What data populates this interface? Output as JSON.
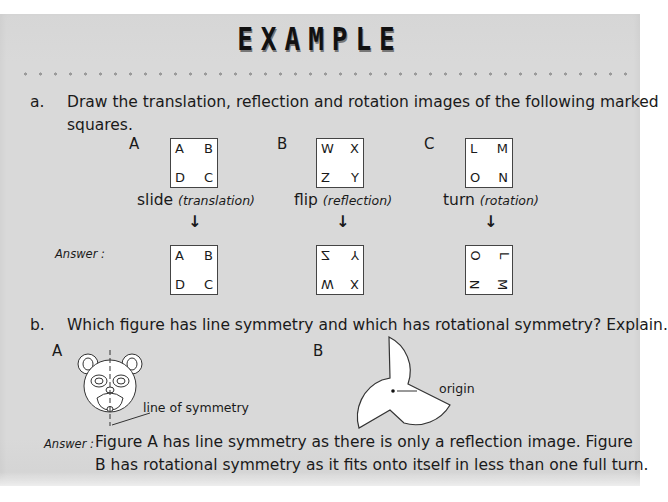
{
  "header": {
    "title": "EXAMPLE"
  },
  "part_a": {
    "marker": "a.",
    "question_line1": "Draw the translation, reflection and rotation images of the following marked",
    "question_line2": "squares.",
    "answer_label": "Answer :",
    "figures": [
      {
        "label": "A",
        "corners": [
          "A",
          "B",
          "D",
          "C"
        ],
        "operation": "slide",
        "operation_note": "(translation)",
        "arrow": "↓",
        "result": [
          "A",
          "B",
          "D",
          "C"
        ]
      },
      {
        "label": "B",
        "corners": [
          "W",
          "X",
          "Z",
          "Y"
        ],
        "operation": "flip",
        "operation_note": "(reflection)",
        "arrow": "↓",
        "result": [
          "Z",
          "Y",
          "W",
          "X"
        ]
      },
      {
        "label": "C",
        "corners": [
          "L",
          "M",
          "O",
          "N"
        ],
        "operation": "turn",
        "operation_note": "(rotation)",
        "arrow": "↓",
        "result": [
          "O",
          "L",
          "N",
          "M"
        ]
      }
    ]
  },
  "part_b": {
    "marker": "b.",
    "question": "Which figure has line symmetry and which has rotational symmetry?  Explain.",
    "figure_a_label": "A",
    "figure_b_label": "B",
    "line_of_symmetry_label": "line of symmetry",
    "origin_label": "origin",
    "answer_label": "Answer :",
    "answer_line1": "Figure A has line symmetry as there is only a reflection image.  Figure",
    "answer_line2": "B has rotational symmetry as it fits onto itself in less than one full turn."
  }
}
